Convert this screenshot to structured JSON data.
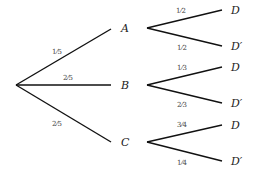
{
  "diagram": {
    "type": "probability-tree",
    "first_level": [
      {
        "label": "A",
        "prob": "1⁄5"
      },
      {
        "label": "B",
        "prob": "2⁄5"
      },
      {
        "label": "C",
        "prob": "2⁄5"
      }
    ],
    "second_level": {
      "A": [
        {
          "label": "D",
          "prob": "1⁄2"
        },
        {
          "label": "D′",
          "prob": "1⁄2"
        }
      ],
      "B": [
        {
          "label": "D",
          "prob": "1⁄3"
        },
        {
          "label": "D′",
          "prob": "2⁄3"
        }
      ],
      "C": [
        {
          "label": "D",
          "prob": "3⁄4"
        },
        {
          "label": "D′",
          "prob": "1⁄4"
        }
      ]
    }
  }
}
